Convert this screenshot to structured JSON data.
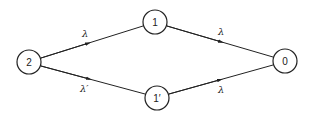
{
  "diagram": {
    "type": "state-transition-graph",
    "nodes": [
      {
        "id": "2",
        "label": "2",
        "x": 29,
        "y": 62
      },
      {
        "id": "1",
        "label": "1",
        "x": 155,
        "y": 22
      },
      {
        "id": "1p",
        "label": "1′",
        "x": 157,
        "y": 98
      },
      {
        "id": "0",
        "label": "0",
        "x": 285,
        "y": 61
      }
    ],
    "edges": [
      {
        "from": "2",
        "to": "1",
        "label": "λ"
      },
      {
        "from": "2",
        "to": "1p",
        "label": "λ′"
      },
      {
        "from": "1",
        "to": "0",
        "label": "λ"
      },
      {
        "from": "1p",
        "to": "0",
        "label": "λ"
      }
    ],
    "colors": {
      "stroke": "#222222",
      "background": "#ffffff"
    }
  }
}
